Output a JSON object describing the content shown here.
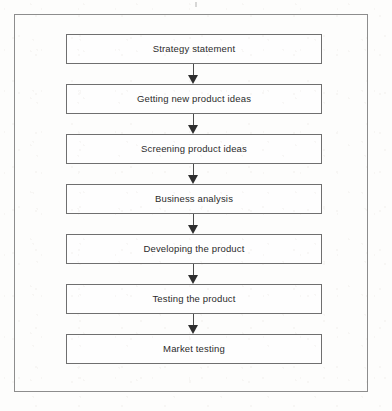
{
  "figure": {
    "type": "flowchart",
    "orientation": "vertical",
    "title": "",
    "frame_color": "#8d8d8d",
    "box_border_color": "#6f6f6f",
    "box_fill_color": "#fefefe",
    "text_color": "#2b2b2b",
    "arrow_color": "#2e2e2e",
    "background_color": "#fdfdfc",
    "steps": [
      {
        "index": 1,
        "label": "Strategy statement"
      },
      {
        "index": 2,
        "label": "Getting new product ideas"
      },
      {
        "index": 3,
        "label": "Screening product ideas"
      },
      {
        "index": 4,
        "label": "Business analysis"
      },
      {
        "index": 5,
        "label": "Developing the product"
      },
      {
        "index": 6,
        "label": "Testing the product"
      },
      {
        "index": 7,
        "label": "Market testing"
      }
    ],
    "connectors": [
      {
        "from": 1,
        "to": 2,
        "icon": "down-arrow-icon"
      },
      {
        "from": 2,
        "to": 3,
        "icon": "down-arrow-icon"
      },
      {
        "from": 3,
        "to": 4,
        "icon": "down-arrow-icon"
      },
      {
        "from": 4,
        "to": 5,
        "icon": "down-arrow-icon"
      },
      {
        "from": 5,
        "to": 6,
        "icon": "down-arrow-icon"
      },
      {
        "from": 6,
        "to": 7,
        "icon": "down-arrow-icon"
      }
    ]
  }
}
